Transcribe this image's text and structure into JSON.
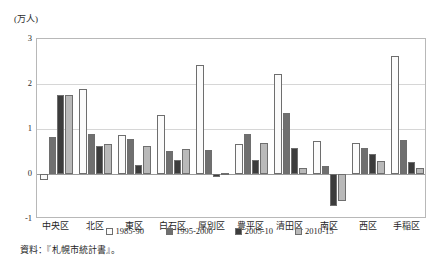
{
  "chart_data": {
    "type": "bar",
    "title": "",
    "ylabel": "(万人)",
    "xlabel": "",
    "ylim": [
      -1,
      3
    ],
    "yticks": [
      3,
      2,
      1,
      0,
      -1
    ],
    "ytick_labels": [
      "3",
      "2",
      "1",
      "0",
      "-1"
    ],
    "grid": true,
    "legend_position": "bottom",
    "categories": [
      "中央区",
      "北区",
      "東区",
      "白石区",
      "厚別区",
      "豊平区",
      "清田区",
      "南区",
      "西区",
      "手稲区"
    ],
    "series": [
      {
        "name": "1985-90",
        "color": "#fbfbfb",
        "values": [
          -0.13,
          1.88,
          0.86,
          1.32,
          2.42,
          0.66,
          2.22,
          0.73,
          0.69,
          2.62
        ]
      },
      {
        "name": "1995-2000",
        "color": "#6f6f6f",
        "values": [
          0.82,
          0.88,
          0.78,
          0.52,
          0.53,
          0.9,
          1.36,
          0.18,
          0.58,
          0.75
        ]
      },
      {
        "name": "2005-10",
        "color": "#3c3c3c",
        "values": [
          1.76,
          0.63,
          0.19,
          0.31,
          -0.07,
          0.32,
          0.58,
          -0.71,
          0.45,
          0.27
        ]
      },
      {
        "name": "2010-15",
        "color": "#b9b9b9",
        "values": [
          1.75,
          0.67,
          0.62,
          0.55,
          0.02,
          0.7,
          0.13,
          -0.6,
          0.29,
          0.14
        ]
      }
    ]
  },
  "source_note": "資料：『札幌市統計書』。"
}
